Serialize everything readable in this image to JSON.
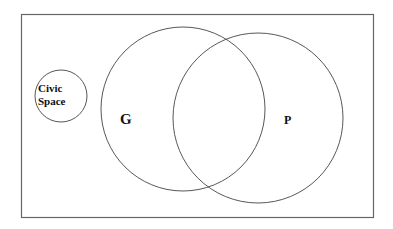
{
  "diagram": {
    "type": "venn",
    "frame": {
      "x": 21,
      "y": 14,
      "width": 353,
      "height": 204,
      "stroke": "#555555"
    },
    "sets": [
      {
        "id": "civic",
        "label_line1": "Civic",
        "label_line2": "Space",
        "cx": 61,
        "cy": 96,
        "r": 26
      },
      {
        "id": "g",
        "label": "G",
        "cx": 183,
        "cy": 109,
        "r": 82
      },
      {
        "id": "p",
        "label": "P",
        "cx": 258,
        "cy": 118,
        "r": 85
      }
    ],
    "stroke_color": "#444444"
  }
}
